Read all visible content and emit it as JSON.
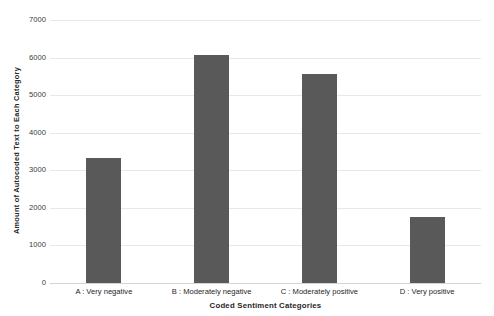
{
  "chart_data": {
    "type": "bar",
    "title": "",
    "xlabel": "Coded Sentiment Categories",
    "ylabel": "Amount of Autocoded Text to Each Category",
    "categories": [
      "A : Very negative",
      "B : Moderately negative",
      "C : Moderately positive",
      "D : Very positive"
    ],
    "values": [
      3330,
      6080,
      5550,
      1750
    ],
    "ylim": [
      0,
      7000
    ],
    "yticks": [
      0,
      1000,
      2000,
      3000,
      4000,
      5000,
      6000,
      7000
    ],
    "ytick_labels": [
      "0",
      "1000",
      "2000",
      "3000",
      "4000",
      "5000",
      "6000",
      "7000"
    ],
    "grid": true,
    "legend": false,
    "bar_color": "#595959",
    "gridline_color": "#e8e8e8",
    "background_color": "#ffffff"
  }
}
